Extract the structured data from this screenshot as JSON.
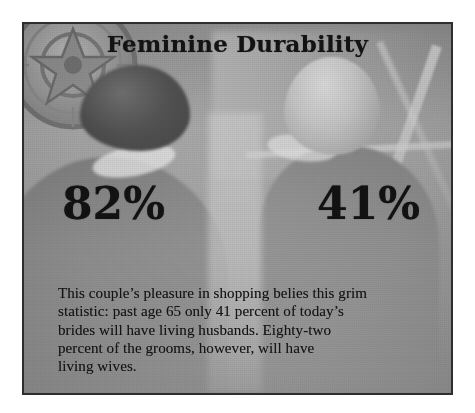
{
  "clipping": {
    "headline": "Feminine Durability",
    "stats": [
      {
        "name": "grooms-living-wives",
        "value": "82%"
      },
      {
        "name": "brides-living-husbands",
        "value": "41%"
      }
    ],
    "caption": {
      "full_text": "This couple's pleasure in shopping belies this grim statistic: past age 65 only 41 percent of today's brides will have living husbands. Eighty-two percent of the grooms, however, will have living wives.",
      "lines": [
        "This couple’s pleasure in shopping belies this grim",
        "statistic: past age 65 only 41 percent of today’s",
        "brides will have living husbands. Eighty-two",
        "percent of the grooms, however, will have",
        "living wives."
      ]
    },
    "photo": {
      "description": "Black-and-white photograph of a couple seen from behind, shopping",
      "subjects": [
        "dark-haired person on the left",
        "light-haired person on the right"
      ],
      "decor": "ornate circular medallion in the upper left"
    },
    "colors": {
      "paper": "#ffffff",
      "photo_gray": "#9d9d9d",
      "frame_border": "#2e2e2e",
      "ink": "#131313"
    }
  }
}
